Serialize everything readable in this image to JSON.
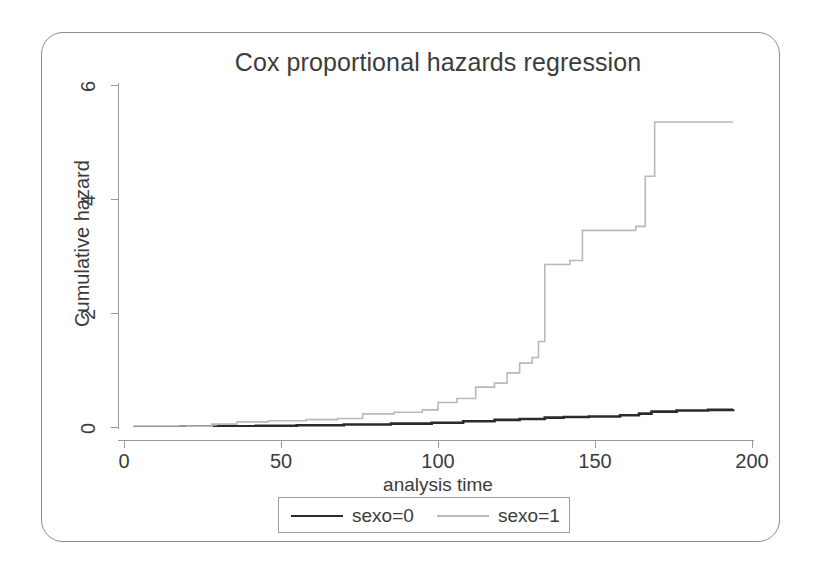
{
  "chart_data": {
    "type": "line",
    "subtype": "step",
    "title": "Cox proportional hazards regression",
    "xlabel": "analysis time",
    "ylabel": "Cumulative hazard",
    "xlim": [
      0,
      200
    ],
    "ylim": [
      0,
      6
    ],
    "xticks": [
      0,
      50,
      100,
      150,
      200
    ],
    "yticks": [
      0,
      2,
      4,
      6
    ],
    "grid": false,
    "legend_position": "below-center",
    "series": [
      {
        "name": "sexo=0",
        "color": "#2b2b2b",
        "linewidth": 2.6,
        "points": [
          [
            3,
            0.0
          ],
          [
            18,
            0.005
          ],
          [
            30,
            0.012
          ],
          [
            42,
            0.02
          ],
          [
            55,
            0.03
          ],
          [
            70,
            0.045
          ],
          [
            85,
            0.06
          ],
          [
            98,
            0.075
          ],
          [
            108,
            0.1
          ],
          [
            118,
            0.125
          ],
          [
            126,
            0.14
          ],
          [
            134,
            0.165
          ],
          [
            140,
            0.175
          ],
          [
            148,
            0.185
          ],
          [
            158,
            0.205
          ],
          [
            164,
            0.235
          ],
          [
            168,
            0.27
          ],
          [
            176,
            0.29
          ],
          [
            186,
            0.3
          ],
          [
            194,
            0.31
          ]
        ]
      },
      {
        "name": "sexo=1",
        "color": "#b9b9b9",
        "linewidth": 1.6,
        "points": [
          [
            3,
            0.0
          ],
          [
            20,
            0.01
          ],
          [
            28,
            0.05
          ],
          [
            36,
            0.09
          ],
          [
            46,
            0.11
          ],
          [
            58,
            0.13
          ],
          [
            68,
            0.15
          ],
          [
            76,
            0.23
          ],
          [
            86,
            0.26
          ],
          [
            95,
            0.3
          ],
          [
            100,
            0.43
          ],
          [
            106,
            0.5
          ],
          [
            112,
            0.7
          ],
          [
            118,
            0.77
          ],
          [
            122,
            0.95
          ],
          [
            126,
            1.12
          ],
          [
            130,
            1.22
          ],
          [
            132,
            1.5
          ],
          [
            134,
            2.85
          ],
          [
            142,
            2.92
          ],
          [
            146,
            3.45
          ],
          [
            163,
            3.52
          ],
          [
            166,
            4.4
          ],
          [
            169,
            5.35
          ],
          [
            194,
            5.35
          ]
        ]
      }
    ]
  },
  "legend": {
    "items": [
      {
        "label": "sexo=0"
      },
      {
        "label": "sexo=1"
      }
    ]
  }
}
